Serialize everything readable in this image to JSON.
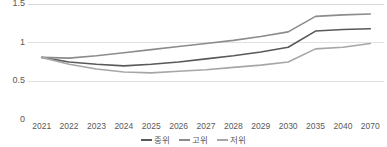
{
  "chart_data": {
    "type": "line",
    "title": "",
    "xlabel": "",
    "ylabel": "",
    "categories": [
      "2021",
      "2022",
      "2023",
      "2024",
      "2025",
      "2026",
      "2027",
      "2028",
      "2029",
      "2030",
      "2035",
      "2040",
      "2070"
    ],
    "ylim": [
      0,
      1.5
    ],
    "yticks": [
      0,
      0.5,
      1,
      1.5
    ],
    "ytick_labels": [
      "0",
      "0.5",
      "1",
      "1.5"
    ],
    "grid": true,
    "legend_position": "bottom",
    "series": [
      {
        "name": "중위",
        "color": "#595959",
        "values": [
          0.81,
          0.75,
          0.72,
          0.7,
          0.72,
          0.75,
          0.79,
          0.83,
          0.88,
          0.94,
          1.15,
          1.17,
          1.18
        ]
      },
      {
        "name": "고위",
        "color": "#8c8c8c",
        "values": [
          0.81,
          0.8,
          0.83,
          0.87,
          0.91,
          0.95,
          0.99,
          1.03,
          1.08,
          1.14,
          1.34,
          1.36,
          1.37
        ]
      },
      {
        "name": "저위",
        "color": "#a6a6a6",
        "values": [
          0.81,
          0.72,
          0.66,
          0.62,
          0.61,
          0.63,
          0.65,
          0.68,
          0.71,
          0.75,
          0.92,
          0.94,
          0.99
        ]
      }
    ]
  },
  "axis": {
    "y_labels": [
      "1.5",
      "1",
      "0.5",
      "0"
    ],
    "x_labels": [
      "2021",
      "2022",
      "2023",
      "2024",
      "2025",
      "2026",
      "2027",
      "2028",
      "2029",
      "2030",
      "2035",
      "2040",
      "2070"
    ]
  },
  "legend": {
    "items": [
      {
        "label": "중위",
        "color": "#595959"
      },
      {
        "label": "고위",
        "color": "#8c8c8c"
      },
      {
        "label": "저위",
        "color": "#a6a6a6"
      }
    ]
  },
  "colors": {
    "gridline": "#d9d9d9",
    "text": "#595959",
    "background": "#ffffff"
  }
}
